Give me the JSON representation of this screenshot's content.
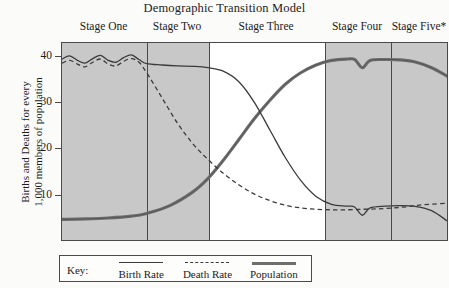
{
  "title": "Demographic Transition Model",
  "y_axis": {
    "title_lines": [
      "Births and Deaths for every",
      "1,000 members of population"
    ],
    "ticks": [
      {
        "label": "40",
        "value": 40
      },
      {
        "label": "30",
        "value": 30
      },
      {
        "label": "20",
        "value": 20
      },
      {
        "label": "10",
        "value": 10
      }
    ]
  },
  "stages": [
    {
      "label": "Stage One",
      "x_start": 0,
      "x_end": 22,
      "shaded": true
    },
    {
      "label": "Stage Two",
      "x_start": 22,
      "x_end": 38,
      "shaded": true
    },
    {
      "label": "Stage Three",
      "x_start": 38,
      "x_end": 68,
      "shaded": false
    },
    {
      "label": "Stage Four",
      "x_start": 68,
      "x_end": 85,
      "shaded": true
    },
    {
      "label": "Stage Five*",
      "x_start": 85,
      "x_end": 100,
      "shaded": true
    }
  ],
  "legend": {
    "key_label": "Key:",
    "entries": [
      {
        "label": "Birth Rate",
        "style": "solid-thin"
      },
      {
        "label": "Death Rate",
        "style": "dashed"
      },
      {
        "label": "Population",
        "style": "solid-thick"
      }
    ]
  },
  "colors": {
    "band_shaded": "#c8c8c8",
    "band_unshaded": "#ffffff",
    "frame": "#4a4a4a",
    "birth_rate": "#3b3b3b",
    "death_rate": "#3b3b3b",
    "population": "#6e6e6e"
  },
  "chart_data": {
    "type": "line",
    "title": "Demographic Transition Model",
    "xlabel": "",
    "ylabel": "Births and Deaths for every 1,000 members of population",
    "ylim": [
      0,
      43
    ],
    "xlim": [
      0,
      100
    ],
    "grid": false,
    "legend_position": "below-plot",
    "y_ticks": [
      10,
      20,
      30,
      40
    ],
    "x_stage_boundaries": [
      0,
      22,
      38,
      68,
      85,
      100
    ],
    "stage_names": [
      "Stage One",
      "Stage Two",
      "Stage Three",
      "Stage Four",
      "Stage Five*"
    ],
    "annotations": [
      "Stage Five is marked with an asterisk (*) indicating a projected/debated stage"
    ],
    "series": [
      {
        "name": "Birth Rate",
        "style": "solid",
        "x": [
          0,
          2,
          4,
          6,
          8,
          10,
          12,
          14,
          16,
          18,
          20,
          22,
          26,
          30,
          34,
          38,
          42,
          46,
          50,
          54,
          58,
          62,
          66,
          70,
          74,
          76,
          78,
          80,
          84,
          88,
          92,
          96,
          100
        ],
        "y": [
          39.5,
          40.2,
          39.2,
          38.6,
          39.6,
          40.3,
          39.2,
          38.8,
          39.8,
          40.4,
          39.4,
          38.5,
          38.2,
          38.0,
          37.9,
          37.6,
          36.8,
          34.5,
          30.0,
          24.0,
          18.0,
          13.0,
          9.5,
          7.8,
          7.4,
          7.2,
          5.4,
          7.0,
          7.4,
          7.5,
          7.3,
          6.4,
          4.2
        ]
      },
      {
        "name": "Death Rate",
        "style": "dashed",
        "x": [
          0,
          2,
          4,
          6,
          8,
          10,
          12,
          14,
          16,
          18,
          20,
          22,
          26,
          30,
          34,
          38,
          42,
          46,
          50,
          54,
          58,
          62,
          66,
          70,
          74,
          78,
          82,
          86,
          90,
          94,
          100
        ],
        "y": [
          38.6,
          39.2,
          38.4,
          37.8,
          38.8,
          39.5,
          38.4,
          38.0,
          39.0,
          39.6,
          38.8,
          36.5,
          31.0,
          25.5,
          21.0,
          17.5,
          14.5,
          12.0,
          10.0,
          8.6,
          7.6,
          7.0,
          6.7,
          6.6,
          6.6,
          6.7,
          6.8,
          7.0,
          7.3,
          7.7,
          8.0
        ]
      },
      {
        "name": "Population",
        "style": "thick",
        "x": [
          0,
          6,
          12,
          18,
          22,
          28,
          34,
          38,
          42,
          46,
          50,
          54,
          58,
          62,
          66,
          70,
          74,
          76,
          78,
          80,
          84,
          88,
          92,
          96,
          100
        ],
        "y": [
          4.5,
          4.6,
          4.8,
          5.2,
          5.8,
          7.5,
          10.5,
          13.5,
          17.5,
          22.0,
          26.5,
          30.5,
          34.0,
          36.5,
          38.2,
          39.2,
          39.5,
          39.4,
          37.6,
          39.2,
          39.4,
          39.3,
          38.8,
          37.6,
          35.8
        ]
      }
    ]
  }
}
